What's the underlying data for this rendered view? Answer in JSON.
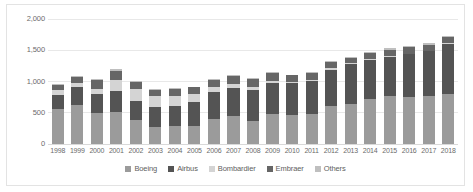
{
  "chart_data": {
    "type": "bar",
    "stacked": true,
    "title": "",
    "subtitle": "",
    "xlabel": "",
    "ylabel": "",
    "ylim": [
      0,
      2000
    ],
    "yticks": [
      "0",
      "500",
      "1,000",
      "1,500",
      "2,000"
    ],
    "ytick_values": [
      0,
      500,
      1000,
      1500,
      2000
    ],
    "grid": true,
    "legend_position": "bottom",
    "categories": [
      "1998",
      "1999",
      "2000",
      "2001",
      "2002",
      "2003",
      "2004",
      "2005",
      "2006",
      "2007",
      "2008",
      "2009",
      "2010",
      "2011",
      "2012",
      "2013",
      "2014",
      "2015",
      "2016",
      "2017",
      "2018"
    ],
    "series": [
      {
        "name": "Boeing",
        "color": "#9b9b9b",
        "values": [
          560,
          620,
          490,
          520,
          380,
          280,
          285,
          290,
          398,
          441,
          375,
          481,
          462,
          477,
          601,
          648,
          723,
          762,
          748,
          763,
          806
        ]
      },
      {
        "name": "Airbus",
        "color": "#545454",
        "values": [
          229,
          294,
          311,
          325,
          303,
          305,
          320,
          378,
          434,
          453,
          483,
          498,
          510,
          534,
          588,
          626,
          629,
          635,
          688,
          718,
          800
        ]
      },
      {
        "name": "Bombardier",
        "color": "#d4d4d4",
        "values": [
          70,
          55,
          78,
          175,
          190,
          180,
          170,
          130,
          74,
          60,
          55,
          30,
          25,
          20,
          20,
          15,
          15,
          12,
          10,
          10,
          10
        ]
      },
      {
        "name": "Embraer",
        "color": "#666666",
        "values": [
          80,
          110,
          145,
          155,
          120,
          105,
          108,
          110,
          122,
          130,
          135,
          122,
          100,
          105,
          106,
          90,
          92,
          101,
          108,
          101,
          90
        ]
      },
      {
        "name": "Others",
        "color": "#bfbfbf",
        "values": [
          18,
          15,
          18,
          20,
          15,
          12,
          12,
          12,
          14,
          15,
          16,
          14,
          14,
          16,
          18,
          18,
          20,
          22,
          22,
          22,
          24
        ]
      }
    ]
  },
  "legend": {
    "items": [
      {
        "label": "Boeing"
      },
      {
        "label": "Airbus"
      },
      {
        "label": "Bombardier"
      },
      {
        "label": "Embraer"
      },
      {
        "label": "Others"
      }
    ]
  }
}
